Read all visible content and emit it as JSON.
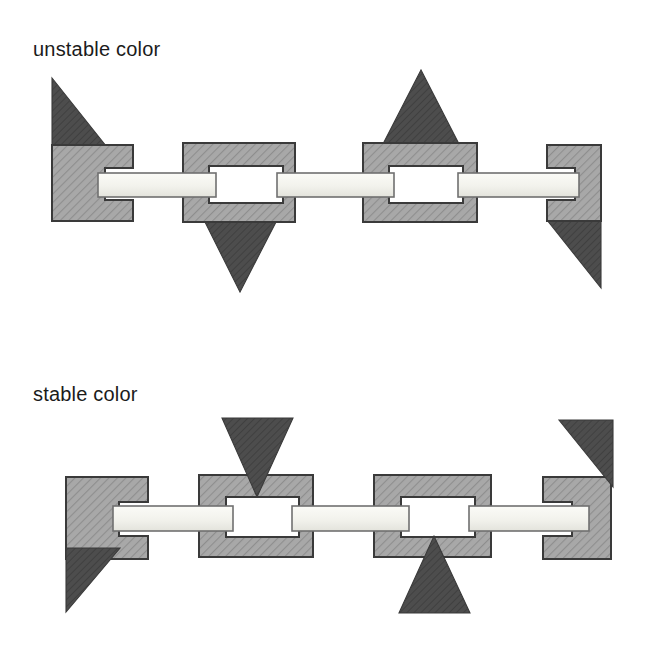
{
  "figure": {
    "background_color": "#ffffff",
    "panels": [
      {
        "id": "unstable",
        "label": "unstable color",
        "chain": {
          "link_count": 4,
          "link_fill_color": "#a3a3a3",
          "link_edge_color": "#3a3a3a",
          "connector_fill_color": "#f2f2ee",
          "connector_edge_color": "#6d6d6d",
          "hole_fill_color": "#ffffff",
          "triangle_color": "#4d4d4d",
          "triangle_count": 4,
          "triangle_attachment": "outside-tangent",
          "triangles": [
            {
              "name": "left-up-right-triangle",
              "direction": "up",
              "shape": "right-triangle",
              "side": "top"
            },
            {
              "name": "center-left-down-triangle",
              "direction": "down",
              "shape": "isosceles",
              "side": "bottom"
            },
            {
              "name": "center-right-up-triangle",
              "direction": "up",
              "shape": "isosceles",
              "side": "top"
            },
            {
              "name": "right-down-right-triangle",
              "direction": "down",
              "shape": "right-triangle",
              "side": "bottom"
            }
          ]
        }
      },
      {
        "id": "stable",
        "label": "stable color",
        "chain": {
          "link_count": 4,
          "link_fill_color": "#a3a3a3",
          "link_edge_color": "#3a3a3a",
          "connector_fill_color": "#f2f2ee",
          "connector_edge_color": "#6d6d6d",
          "hole_fill_color": "#ffffff",
          "triangle_color": "#4d4d4d",
          "triangle_count": 4,
          "triangle_attachment": "embedded-apex-inward",
          "triangles": [
            {
              "name": "left-down-left-triangle",
              "direction": "down",
              "shape": "right-triangle",
              "side": "bottom"
            },
            {
              "name": "center-left-down-triangle",
              "direction": "down",
              "shape": "isosceles",
              "side": "top"
            },
            {
              "name": "center-right-up-triangle",
              "direction": "up",
              "shape": "isosceles",
              "side": "bottom"
            },
            {
              "name": "right-down-left-triangle",
              "direction": "down",
              "shape": "right-triangle",
              "side": "top"
            }
          ]
        }
      }
    ]
  }
}
